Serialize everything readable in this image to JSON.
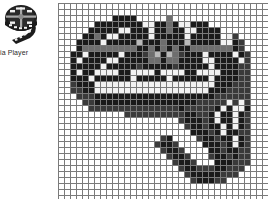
{
  "desktop_icon": {
    "name": "media-player-shortcut",
    "icon": "film-reel-icon",
    "label": "ia Player",
    "label_full": "Media Player",
    "label_truncated": true
  },
  "zoom_grid": {
    "name": "pixel-zoom-grid",
    "columns": 35,
    "rows": 33,
    "cell_px": 6,
    "grid_line_color": "#7a7a7a",
    "background_color": "#ffffff",
    "palette": {
      "empty": "#ffffff",
      "black": "#1a1a1a",
      "dark": "#3a3a3a",
      "mid": "#6e6e6e",
      "light": "#b9b9b9",
      "white": "#f2f2f2"
    },
    "legend": [
      {
        "key": ".",
        "label": "empty",
        "color": "#ffffff"
      },
      {
        "key": "#",
        "label": "black",
        "color": "#1a1a1a"
      },
      {
        "key": "d",
        "label": "dark gray",
        "color": "#3a3a3a"
      },
      {
        "key": "m",
        "label": "mid gray",
        "color": "#6e6e6e"
      },
      {
        "key": "l",
        "label": "light gray",
        "color": "#b9b9b9"
      },
      {
        "key": "w",
        "label": "white pixel",
        "color": "#f2f2f2"
      }
    ],
    "pixels": [
      "...................................",
      "...................................",
      ".........####.....m................",
      "......########ww##m#ww###..........",
      ".....#####ww###w##m##ww####........",
      "....##m#ww#####w#####w#####.wd.....",
      "...####w#####l###m###l#####ww#d....",
      "...#mmmmmmmmm##m#m#m##mmmmmmm#d....",
      "..##w#####w###dml#lmd###w####w#d...",
      "..#w####ww#####mm#mm####ww####wd...",
      "..#####w#####d#####d#####w####dd...",
      "..#w##wwww##wwww#wwww##wwww###dd...",
      "..###w######w#####w######w####dd...",
      "..d###wwwwwwwwwwwwwwwwwwww###ddd...",
      "..dd##wwwwwwwwwwwwwwwwwww###dddd...",
      "...ddd####################dddddd...",
      "....dd#################dddddwdwd...",
      ".....ddddddddddddddd#ddddd#w#ww#...",
      "...........dddddddddd##dd#w##w#d...",
      "....................d###d#w##w#d...",
      ".....................d##d##w#w#d...",
      "......................###d#w##dd...",
      ".................d#....d##d##w#d...",
      "................d##d....###d#w#d...",
      ".................d##d....##d##dd...",
      "..................d##d...d##d#dd...",
      "...................d##d...###ddd...",
      "....................d##ddd##ddd....",
      ".....................d#####ddd.....",
      "......................d###dd.......",
      "...................................",
      "...................................",
      "..................................."
    ]
  }
}
